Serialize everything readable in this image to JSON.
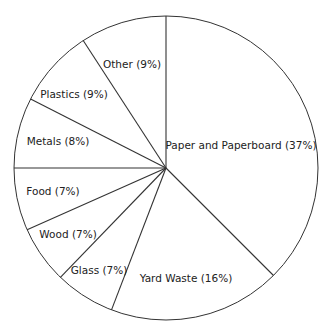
{
  "chart_data": {
    "type": "pie",
    "title": "",
    "start_angle_deg": 0,
    "direction": "clockwise",
    "categories": [
      "Paper and Paperboard",
      "Yard Waste",
      "Glass",
      "Wood",
      "Food",
      "Metals",
      "Plastics",
      "Other"
    ],
    "values": [
      37,
      16,
      7,
      7,
      7,
      8,
      9,
      9
    ],
    "unit": "%",
    "legend": "none (inline labels)",
    "slices": [
      {
        "name": "Paper and Paperboard",
        "value": 37,
        "label": "Paper and Paperboard (37%)",
        "end_deg": 135,
        "lx": 241,
        "ly": 149
      },
      {
        "name": "Yard Waste",
        "value": 16,
        "label": "Yard Waste (16%)",
        "end_deg": 201,
        "lx": 186,
        "ly": 282
      },
      {
        "name": "Glass",
        "value": 7,
        "label": "Glass (7%)",
        "end_deg": 224,
        "lx": 99,
        "ly": 274
      },
      {
        "name": "Wood",
        "value": 7,
        "label": "Wood (7%)",
        "end_deg": 246,
        "lx": 68,
        "ly": 238
      },
      {
        "name": "Food",
        "value": 7,
        "label": "Food (7%)",
        "end_deg": 270,
        "lx": 53,
        "ly": 195
      },
      {
        "name": "Metals",
        "value": 8,
        "label": "Metals (8%)",
        "end_deg": 297,
        "lx": 58,
        "ly": 145
      },
      {
        "name": "Plastics",
        "value": 9,
        "label": "Plastics (9%)",
        "end_deg": 327,
        "lx": 74,
        "ly": 98
      },
      {
        "name": "Other",
        "value": 9,
        "label": "Other (9%)",
        "end_deg": 360,
        "lx": 132,
        "ly": 68
      }
    ],
    "colors": {
      "fill": "#ffffff",
      "stroke": "#333333",
      "text": "#222222"
    }
  }
}
